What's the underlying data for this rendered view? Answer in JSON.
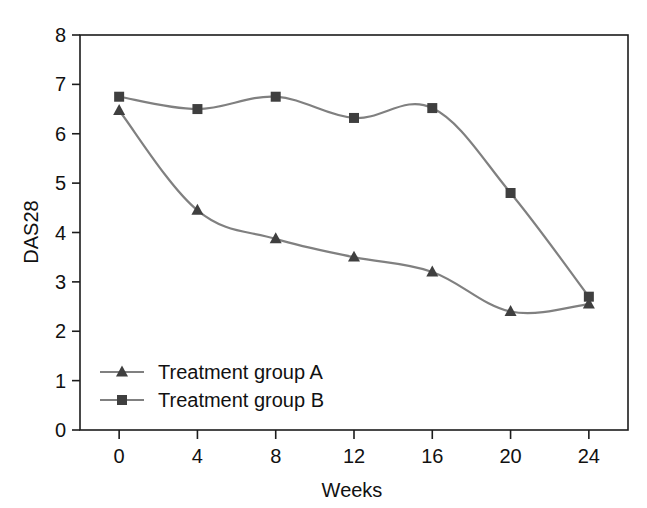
{
  "chart_data": {
    "type": "line",
    "title": "",
    "xlabel": "Weeks",
    "ylabel": "DAS28",
    "x": [
      0,
      4,
      8,
      12,
      16,
      20,
      24
    ],
    "xticklabels": [
      "0",
      "4",
      "8",
      "12",
      "16",
      "20",
      "24"
    ],
    "yticklabels": [
      "0",
      "1",
      "2",
      "3",
      "4",
      "5",
      "6",
      "7",
      "8"
    ],
    "xlim": [
      -2,
      26
    ],
    "ylim": [
      0,
      8
    ],
    "grid": false,
    "legend_position": "bottom-left-inside",
    "series": [
      {
        "name": "Treatment group A",
        "marker": "triangle",
        "color": "#3f3f3f",
        "line_color": "#808080",
        "values": [
          6.47,
          4.45,
          3.87,
          3.5,
          3.2,
          2.4,
          2.55
        ]
      },
      {
        "name": "Treatment group B",
        "marker": "square",
        "color": "#3f3f3f",
        "line_color": "#808080",
        "values": [
          6.75,
          6.5,
          6.75,
          6.32,
          6.52,
          4.8,
          2.7
        ]
      }
    ]
  },
  "colors": {
    "axis": "#1c1c1c",
    "line": "#808080",
    "marker": "#3f3f3f",
    "background": "#ffffff"
  }
}
